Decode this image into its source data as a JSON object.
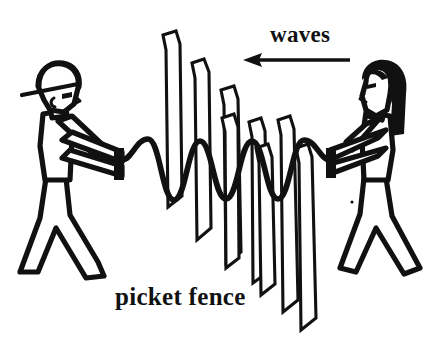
{
  "figure": {
    "background_color": "#ffffff",
    "ink_color": "#111111",
    "width": 443,
    "height": 355
  },
  "labels": {
    "waves": "waves",
    "picket_fence": "picket fence"
  },
  "annotations": {
    "direction_arrow": {
      "name": "waves-direction-arrow",
      "points": "left",
      "x_start": 350,
      "x_end": 243,
      "y": 60
    }
  },
  "actors": {
    "left_person": {
      "name": "man-with-cap",
      "facing": "right",
      "headwear": "baseball-cap",
      "hair": "none",
      "holds": "rope-end",
      "style": "outline"
    },
    "right_person": {
      "name": "woman-with-long-hair",
      "facing": "left",
      "headwear": "none",
      "hair": "long-black",
      "holds": "rope-end",
      "style": "outline"
    }
  },
  "objects": {
    "rope": {
      "name": "vibrating-rope",
      "shape": "sine-wave",
      "orientation": "vertical-oscillation",
      "crest_count": 4
    },
    "fence": {
      "name": "picket-fence",
      "picket_count": 8,
      "perspective": "receding-right",
      "picket_tops": "chamfered"
    }
  }
}
